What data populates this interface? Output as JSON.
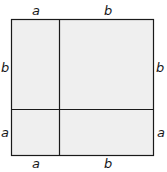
{
  "diagram": {
    "fill_color": "#efefef",
    "stroke_color": "#1a1a1a",
    "labels": {
      "top_left": "a",
      "top_right": "b",
      "left_upper": "b",
      "left_lower": "a",
      "right_upper": "b",
      "right_lower": "a",
      "bottom_left": "a",
      "bottom_right": "b"
    }
  }
}
